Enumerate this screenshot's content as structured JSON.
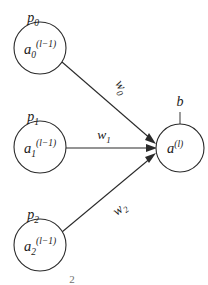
{
  "diagram": {
    "type": "neural-network-neuron",
    "background_color": "#ffffff",
    "stroke_color": "#2b2b2b",
    "text_color": "#1a1a1a",
    "input_nodes": [
      {
        "id": "input-0",
        "label": "p",
        "label_sub": "0",
        "body_base": "a",
        "body_sub": "0",
        "body_sup": "(l−1)",
        "cx": 40,
        "cy": 48,
        "r": 26
      },
      {
        "id": "input-1",
        "label": "p",
        "label_sub": "1",
        "body_base": "a",
        "body_sub": "1",
        "body_sup": "(l−1)",
        "cx": 40,
        "cy": 147,
        "r": 26
      },
      {
        "id": "input-2",
        "label": "p",
        "label_sub": "2",
        "body_base": "a",
        "body_sub": "2",
        "body_sup": "(l−1)",
        "cx": 40,
        "cy": 245,
        "r": 26
      }
    ],
    "output_node": {
      "id": "output",
      "body_base": "a",
      "body_sup": "(l)",
      "cx": 180,
      "cy": 148,
      "r": 24
    },
    "bias": {
      "label": "b",
      "stem_top_y": 112,
      "stem_bottom_y": 124
    },
    "weights": [
      {
        "id": "w0",
        "base": "w",
        "sub": "0",
        "rotation_deg": 60
      },
      {
        "id": "w1",
        "base": "w",
        "sub": "1",
        "rotation_deg": 0
      },
      {
        "id": "w2",
        "base": "w",
        "sub": "2",
        "rotation_deg": -38
      }
    ],
    "stray_mark": "2"
  }
}
